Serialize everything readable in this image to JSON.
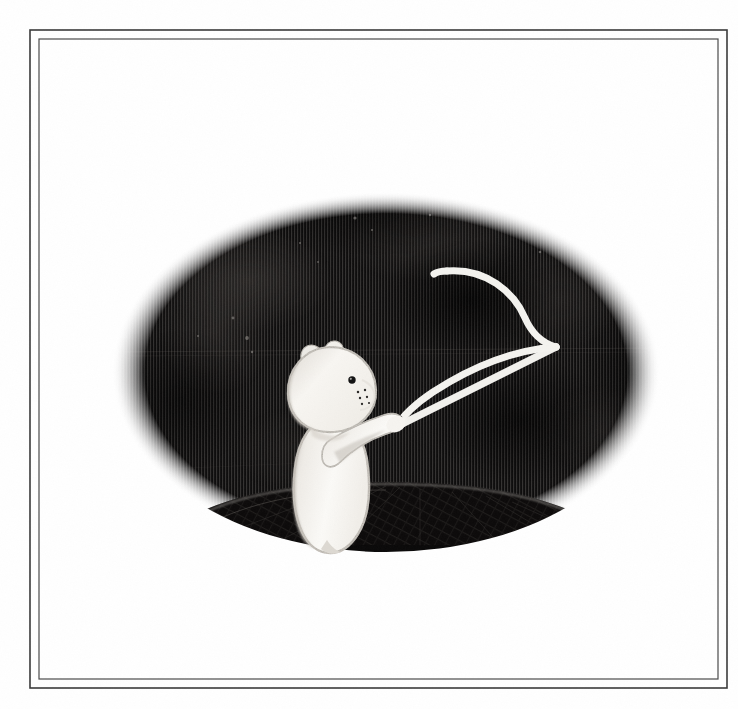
{
  "page": {
    "background_color": "#ffffff",
    "width": 738,
    "height": 709,
    "medium": "ink-and-wash book illustration"
  },
  "frame": {
    "outer": {
      "x": 30,
      "y": 30,
      "width": 697,
      "height": 658,
      "stroke_color": "#3a3a3a",
      "stroke_width": 1.6
    },
    "inner": {
      "x": 39,
      "y": 39,
      "width": 679,
      "height": 640,
      "stroke_color": "#4a4a4a",
      "stroke_width": 1.2
    }
  },
  "scene": {
    "vignette": {
      "name": "black-oval-vignette",
      "cx": 386,
      "cy": 372,
      "rx": 274,
      "ry": 180,
      "fill_color": "#100f0f",
      "texture": "fine vertical hatching",
      "hatch_color": "#2e2c2b",
      "hatch_spacing_px": 3
    },
    "hill": {
      "name": "dark-hill-mound",
      "fill_color": "#151414",
      "rim_highlight_color": "#8d8a86",
      "texture": "diagonal crosshatching"
    },
    "character": {
      "name": "white-bear",
      "species": "bear",
      "color": "#f7f6f2",
      "shadow_color": "#bdb9b3",
      "pose": "standing, right arm raised holding a flag",
      "eye_color": "#111111",
      "ear_inner_color": "#c9c5bf",
      "freckle_count": 6
    },
    "flag": {
      "name": "white-flag",
      "style": "outline pennant, waving",
      "stroke_color": "#f4f3ef",
      "pole_color": "#f2f1ed",
      "stroke_width": 7
    }
  }
}
